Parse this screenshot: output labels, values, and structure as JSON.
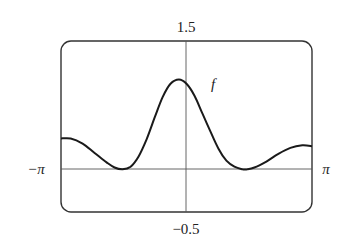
{
  "chart_data": {
    "type": "line",
    "title": "",
    "xlabel": "",
    "ylabel": "",
    "xlim": [
      -3.14159,
      3.14159
    ],
    "ylim": [
      -0.5,
      1.5
    ],
    "x_tick_labels": {
      "left": "−π",
      "right": "π"
    },
    "y_tick_labels": {
      "top": "1.5",
      "bottom": "−0.5"
    },
    "grid": false,
    "legend": null,
    "annotations": [
      {
        "text": "f",
        "x": 0.6,
        "y": 0.95
      }
    ],
    "series": [
      {
        "name": "f",
        "x": [
          -3.14159,
          -2.9,
          -2.6,
          -2.3,
          -2.0,
          -1.8,
          -1.6,
          -1.4,
          -1.2,
          -1.0,
          -0.8,
          -0.6,
          -0.4,
          -0.19,
          0.0,
          0.2,
          0.4,
          0.6,
          0.8,
          1.0,
          1.2,
          1.4,
          1.52,
          1.7,
          2.0,
          2.3,
          2.6,
          2.9,
          3.14159
        ],
        "y": [
          0.36,
          0.36,
          0.3,
          0.19,
          0.08,
          0.02,
          0.0,
          0.03,
          0.15,
          0.35,
          0.6,
          0.84,
          1.0,
          1.05,
          1.0,
          0.86,
          0.65,
          0.44,
          0.24,
          0.1,
          0.03,
          0.0,
          0.0,
          0.02,
          0.09,
          0.18,
          0.25,
          0.28,
          0.27
        ]
      }
    ]
  },
  "labels": {
    "y_top": "1.5",
    "y_bottom": "−0.5",
    "x_left": "−π",
    "x_right": "π",
    "curve_name": "f"
  }
}
